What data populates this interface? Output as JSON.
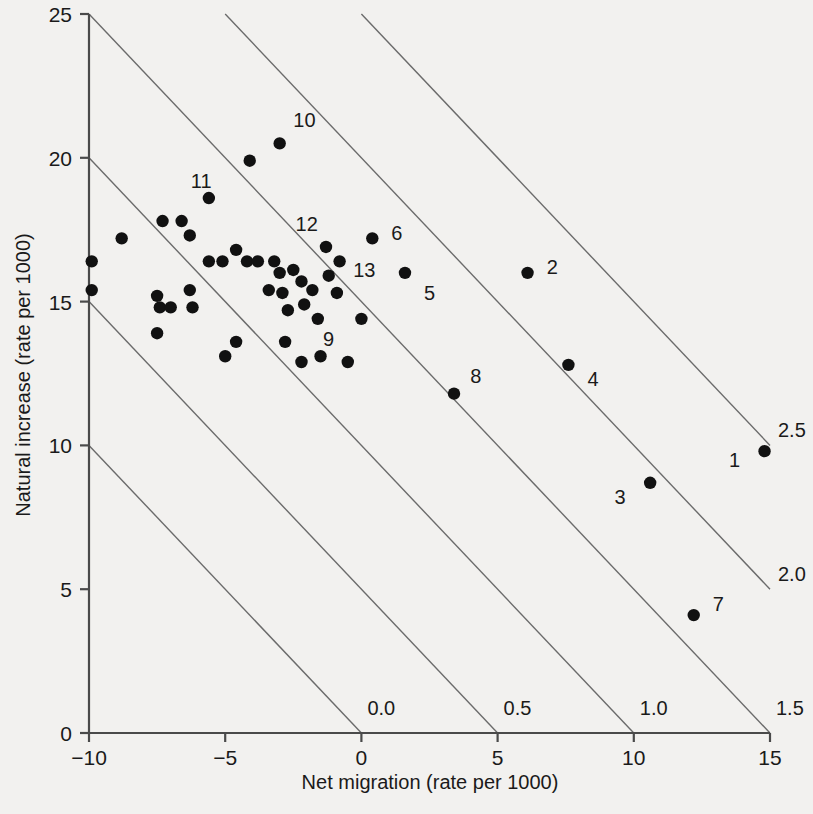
{
  "chart_data": {
    "type": "scatter",
    "title": "",
    "xlabel": "Net migration (rate per 1000)",
    "ylabel": "Natural increase (rate per 1000)",
    "xlim": [
      -10,
      15
    ],
    "ylim": [
      0,
      25
    ],
    "xticks": [
      -10,
      -5,
      0,
      5,
      10,
      15
    ],
    "xticklabels": [
      "−10",
      "−5",
      "0",
      "5",
      "10",
      "15"
    ],
    "yticks": [
      0,
      5,
      10,
      15,
      20,
      25
    ],
    "yticklabels": [
      "0",
      "5",
      "10",
      "15",
      "20",
      "25"
    ],
    "grid": false,
    "legend": "none",
    "contours": {
      "description": "Diagonal iso-growth lines where natural increase + net migration equals a constant total growth rate (percent per year)",
      "lines": [
        {
          "label": "0.0",
          "value": 0.0,
          "x_at_axis": 0
        },
        {
          "label": "0.5",
          "value": 0.5,
          "x_at_axis": 5
        },
        {
          "label": "1.0",
          "value": 1.0,
          "x_at_axis": 10
        },
        {
          "label": "1.5",
          "value": 1.5,
          "x_at_axis": 15
        },
        {
          "label": "2.0",
          "value": 2.0,
          "x_at_axis": 20
        },
        {
          "label": "2.5",
          "value": 2.5,
          "x_at_axis": 25
        }
      ],
      "right_labels": [
        "2.5",
        "2.0"
      ],
      "bottom_labels": [
        "0.0",
        "0.5",
        "1.0",
        "1.5"
      ]
    },
    "labeled_points": [
      {
        "label": "1",
        "x": 14.8,
        "y": 9.8,
        "lx": -0.9,
        "ly": -0.3
      },
      {
        "label": "2",
        "x": 6.1,
        "y": 16.0,
        "lx": 0.7,
        "ly": 0.2
      },
      {
        "label": "3",
        "x": 10.6,
        "y": 8.7,
        "lx": -0.9,
        "ly": -0.5
      },
      {
        "label": "4",
        "x": 7.6,
        "y": 12.8,
        "lx": 0.7,
        "ly": -0.5
      },
      {
        "label": "5",
        "x": 1.6,
        "y": 16.0,
        "lx": 0.7,
        "ly": -0.7
      },
      {
        "label": "6",
        "x": 0.4,
        "y": 17.2,
        "lx": 0.7,
        "ly": 0.2
      },
      {
        "label": "7",
        "x": 12.2,
        "y": 4.1,
        "lx": 0.7,
        "ly": 0.4
      },
      {
        "label": "8",
        "x": 3.4,
        "y": 11.8,
        "lx": 0.6,
        "ly": 0.6
      },
      {
        "label": "9",
        "x": 0.0,
        "y": 14.4,
        "lx": -1.0,
        "ly": -0.7
      },
      {
        "label": "10",
        "x": -3.0,
        "y": 20.5,
        "lx": 0.5,
        "ly": 0.8
      },
      {
        "label": "11",
        "x": -4.1,
        "y": 19.9,
        "lx": -1.4,
        "ly": -0.7
      },
      {
        "label": "12",
        "x": -1.3,
        "y": 16.9,
        "lx": -0.3,
        "ly": 0.8
      },
      {
        "label": "13",
        "x": -0.8,
        "y": 16.4,
        "lx": 0.5,
        "ly": -0.3
      }
    ],
    "unlabeled_points": [
      {
        "x": -9.9,
        "y": 16.4
      },
      {
        "x": -9.9,
        "y": 15.4
      },
      {
        "x": -8.8,
        "y": 17.2
      },
      {
        "x": -7.3,
        "y": 17.8
      },
      {
        "x": -6.6,
        "y": 17.8
      },
      {
        "x": -6.3,
        "y": 17.3
      },
      {
        "x": -5.6,
        "y": 18.6
      },
      {
        "x": -7.5,
        "y": 15.2
      },
      {
        "x": -7.4,
        "y": 14.8
      },
      {
        "x": -7.5,
        "y": 13.9
      },
      {
        "x": -7.0,
        "y": 14.8
      },
      {
        "x": -6.3,
        "y": 15.4
      },
      {
        "x": -6.2,
        "y": 14.8
      },
      {
        "x": -5.6,
        "y": 16.4
      },
      {
        "x": -5.1,
        "y": 16.4
      },
      {
        "x": -4.6,
        "y": 16.8
      },
      {
        "x": -4.2,
        "y": 16.4
      },
      {
        "x": -3.8,
        "y": 16.4
      },
      {
        "x": -4.6,
        "y": 13.6
      },
      {
        "x": -5.0,
        "y": 13.1
      },
      {
        "x": -3.4,
        "y": 15.4
      },
      {
        "x": -3.2,
        "y": 16.4
      },
      {
        "x": -3.0,
        "y": 16.0
      },
      {
        "x": -2.9,
        "y": 15.3
      },
      {
        "x": -2.7,
        "y": 14.7
      },
      {
        "x": -2.8,
        "y": 13.6
      },
      {
        "x": -2.5,
        "y": 16.1
      },
      {
        "x": -2.2,
        "y": 15.7
      },
      {
        "x": -2.1,
        "y": 14.9
      },
      {
        "x": -2.2,
        "y": 12.9
      },
      {
        "x": -1.8,
        "y": 15.4
      },
      {
        "x": -1.6,
        "y": 14.4
      },
      {
        "x": -1.5,
        "y": 13.1
      },
      {
        "x": -1.2,
        "y": 15.9
      },
      {
        "x": -0.9,
        "y": 15.3
      },
      {
        "x": -0.5,
        "y": 12.9
      }
    ]
  }
}
